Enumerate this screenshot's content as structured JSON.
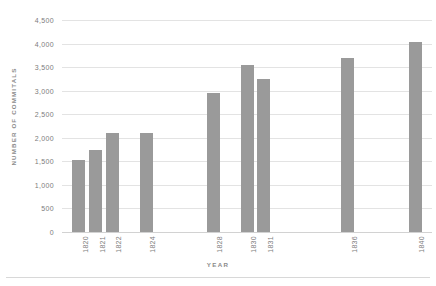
{
  "chart_data": {
    "type": "bar",
    "title": "",
    "xlabel": "YEAR",
    "ylabel": "NUMBER OF COMMITALS",
    "categories": [
      "1820",
      "1821",
      "1822",
      "1824",
      "1828",
      "1830",
      "1831",
      "1836",
      "1840"
    ],
    "x": [
      1820,
      1821,
      1822,
      1824,
      1828,
      1830,
      1831,
      1836,
      1840
    ],
    "values": [
      1520,
      1740,
      2100,
      2110,
      2950,
      3550,
      3240,
      3690,
      4030
    ],
    "ylim": [
      0,
      4500
    ],
    "xlim": [
      1819,
      1841
    ],
    "ytick_values": [
      0,
      500,
      1000,
      1500,
      2000,
      2500,
      3000,
      3500,
      4000,
      4500
    ],
    "ytick_labels": [
      "0",
      "500",
      "1,000",
      "1,500",
      "2,000",
      "2,500",
      "3,000",
      "3,500",
      "4,000",
      "4,500"
    ],
    "grid": true,
    "legend": null,
    "bar_color": "#9a9a9a",
    "gridline_color": "#e3e3e3",
    "background_color": "#ffffff",
    "text_color": "#7d7d7d"
  }
}
